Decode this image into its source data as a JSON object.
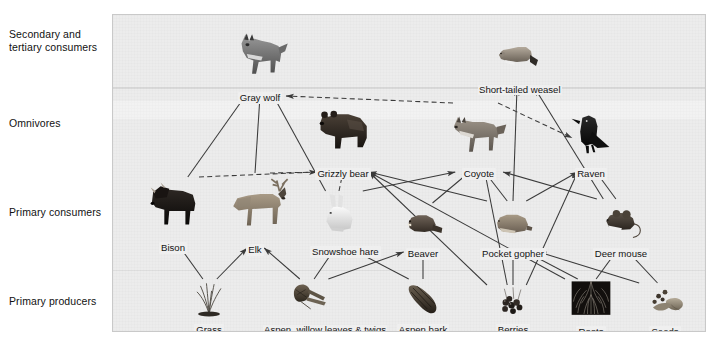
{
  "figure": {
    "type": "food-web-diagram",
    "title": "",
    "panel_background": "#ececec"
  },
  "tiers": [
    {
      "id": "secondary-tertiary",
      "label": "Secondary and\ntertiary consumers",
      "y": 28
    },
    {
      "id": "omnivores",
      "label": "Omnivores",
      "y": 117
    },
    {
      "id": "primary-consumers",
      "label": "Primary consumers",
      "y": 206
    },
    {
      "id": "primary-producers",
      "label": "Primary producers",
      "y": 295
    }
  ],
  "nodes": [
    {
      "id": "gray-wolf",
      "label": "Gray wolf",
      "tier": "secondary-tertiary",
      "x": 147,
      "y": 6,
      "w": 92,
      "h": 66,
      "kind": "animal"
    },
    {
      "id": "short-tailed-weasel",
      "label": "Short-tailed weasel",
      "tier": "secondary-tertiary",
      "x": 404,
      "y": 14,
      "w": 78,
      "h": 50,
      "kind": "animal"
    },
    {
      "id": "grizzly-bear",
      "label": "Grizzly bear",
      "tier": "omnivores",
      "x": 230,
      "y": 82,
      "w": 118,
      "h": 66,
      "kind": "animal"
    },
    {
      "id": "coyote",
      "label": "Coyote",
      "tier": "omnivores",
      "x": 366,
      "y": 86,
      "w": 104,
      "h": 62,
      "kind": "animal"
    },
    {
      "id": "raven",
      "label": "Raven",
      "tier": "omnivores",
      "x": 478,
      "y": 92,
      "w": 54,
      "h": 56,
      "kind": "animal"
    },
    {
      "id": "bison",
      "label": "Bison",
      "tier": "primary-consumers",
      "x": 60,
      "y": 160,
      "w": 90,
      "h": 62,
      "kind": "animal"
    },
    {
      "id": "elk",
      "label": "Elk",
      "tier": "primary-consumers",
      "x": 142,
      "y": 156,
      "w": 92,
      "h": 68,
      "kind": "animal"
    },
    {
      "id": "snowshoe-hare",
      "label": "Snowshoe hare",
      "tier": "primary-consumers",
      "x": 226,
      "y": 174,
      "w": 58,
      "h": 52,
      "kind": "animal"
    },
    {
      "id": "beaver",
      "label": "Beaver",
      "tier": "primary-consumers",
      "x": 310,
      "y": 186,
      "w": 68,
      "h": 42,
      "kind": "animal"
    },
    {
      "id": "pocket-gopher",
      "label": "Pocket gopher",
      "tier": "primary-consumers",
      "x": 400,
      "y": 184,
      "w": 80,
      "h": 44,
      "kind": "animal"
    },
    {
      "id": "deer-mouse",
      "label": "Deer mouse",
      "tier": "primary-consumers",
      "x": 508,
      "y": 182,
      "w": 74,
      "h": 46,
      "kind": "animal"
    },
    {
      "id": "grass",
      "label": "Grass",
      "tier": "primary-producers",
      "x": 96,
      "y": 262,
      "w": 56,
      "h": 42,
      "kind": "plant"
    },
    {
      "id": "aspen-willow",
      "label": "Aspen, willow leaves & twigs",
      "tier": "primary-producers",
      "x": 196,
      "y": 262,
      "w": 92,
      "h": 42,
      "kind": "plant"
    },
    {
      "id": "aspen-bark",
      "label": "Aspen bark",
      "tier": "primary-producers",
      "x": 310,
      "y": 262,
      "w": 58,
      "h": 42,
      "kind": "plant"
    },
    {
      "id": "berries",
      "label": "Berries",
      "tier": "primary-producers",
      "x": 400,
      "y": 268,
      "w": 52,
      "h": 36,
      "kind": "plant"
    },
    {
      "id": "roots",
      "label": "Roots",
      "tier": "primary-producers",
      "x": 478,
      "y": 262,
      "w": 52,
      "h": 44,
      "kind": "plant"
    },
    {
      "id": "seeds",
      "label": "Seeds",
      "tier": "primary-producers",
      "x": 552,
      "y": 266,
      "w": 56,
      "h": 40,
      "kind": "plant"
    }
  ],
  "links": [
    {
      "from": "bison",
      "to": "gray-wolf",
      "style": "solid"
    },
    {
      "from": "elk",
      "to": "gray-wolf",
      "style": "solid"
    },
    {
      "from": "snowshoe-hare",
      "to": "gray-wolf",
      "style": "solid"
    },
    {
      "from": "coyote",
      "to": "gray-wolf",
      "style": "dashed"
    },
    {
      "from": "bison",
      "to": "grizzly-bear",
      "style": "dashed"
    },
    {
      "from": "elk",
      "to": "grizzly-bear",
      "style": "dashed"
    },
    {
      "from": "snowshoe-hare",
      "to": "grizzly-bear",
      "style": "dashed"
    },
    {
      "from": "berries",
      "to": "grizzly-bear",
      "style": "solid"
    },
    {
      "from": "roots",
      "to": "grizzly-bear",
      "style": "solid"
    },
    {
      "from": "pocket-gopher",
      "to": "grizzly-bear",
      "style": "solid"
    },
    {
      "from": "snowshoe-hare",
      "to": "coyote",
      "style": "solid"
    },
    {
      "from": "beaver",
      "to": "coyote",
      "style": "solid"
    },
    {
      "from": "pocket-gopher",
      "to": "coyote",
      "style": "solid"
    },
    {
      "from": "deer-mouse",
      "to": "coyote",
      "style": "solid"
    },
    {
      "from": "berries",
      "to": "coyote",
      "style": "solid"
    },
    {
      "from": "coyote",
      "to": "raven",
      "style": "dashed"
    },
    {
      "from": "pocket-gopher",
      "to": "raven",
      "style": "solid"
    },
    {
      "from": "deer-mouse",
      "to": "raven",
      "style": "solid"
    },
    {
      "from": "berries",
      "to": "raven",
      "style": "solid"
    },
    {
      "from": "pocket-gopher",
      "to": "short-tailed-weasel",
      "style": "solid"
    },
    {
      "from": "deer-mouse",
      "to": "short-tailed-weasel",
      "style": "solid"
    },
    {
      "from": "grass",
      "to": "bison",
      "style": "solid"
    },
    {
      "from": "grass",
      "to": "elk",
      "style": "solid"
    },
    {
      "from": "aspen-willow",
      "to": "elk",
      "style": "solid"
    },
    {
      "from": "aspen-willow",
      "to": "snowshoe-hare",
      "style": "solid"
    },
    {
      "from": "aspen-bark",
      "to": "snowshoe-hare",
      "style": "solid"
    },
    {
      "from": "aspen-bark",
      "to": "beaver",
      "style": "solid"
    },
    {
      "from": "aspen-willow",
      "to": "beaver",
      "style": "solid"
    },
    {
      "from": "roots",
      "to": "pocket-gopher",
      "style": "solid"
    },
    {
      "from": "berries",
      "to": "pocket-gopher",
      "style": "solid"
    },
    {
      "from": "seeds",
      "to": "pocket-gopher",
      "style": "solid"
    },
    {
      "from": "seeds",
      "to": "deer-mouse",
      "style": "solid"
    },
    {
      "from": "roots",
      "to": "deer-mouse",
      "style": "solid"
    }
  ]
}
